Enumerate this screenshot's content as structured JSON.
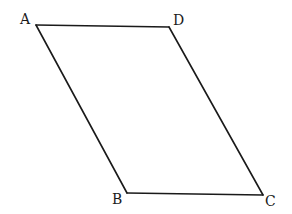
{
  "figure": {
    "type": "parallelogram",
    "vertices": [
      {
        "label": "A",
        "x": 36,
        "y": 25,
        "label_x": 20,
        "label_y": 24
      },
      {
        "label": "D",
        "x": 169,
        "y": 27,
        "label_x": 173,
        "label_y": 25
      },
      {
        "label": "C",
        "x": 263,
        "y": 195,
        "label_x": 265,
        "label_y": 206
      },
      {
        "label": "B",
        "x": 127,
        "y": 193,
        "label_x": 112,
        "label_y": 204
      }
    ],
    "edges": [
      [
        "A",
        "D"
      ],
      [
        "D",
        "C"
      ],
      [
        "C",
        "B"
      ],
      [
        "B",
        "A"
      ]
    ]
  }
}
